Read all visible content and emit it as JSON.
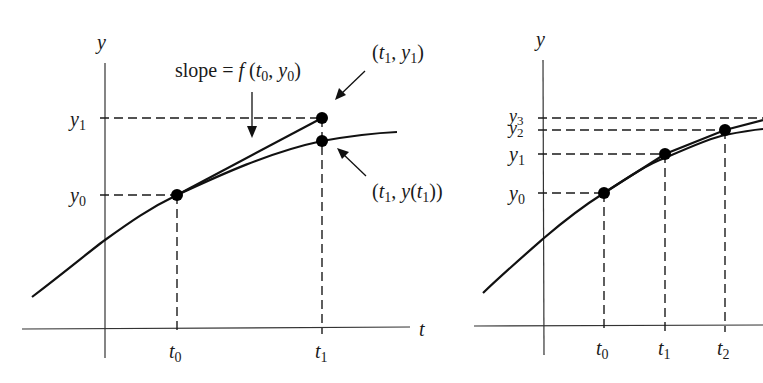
{
  "figure": {
    "left_panel": {
      "y_axis_label": "y",
      "t_axis_label": "t",
      "y_ticks": [
        {
          "base": "y",
          "sub": "1"
        },
        {
          "base": "y",
          "sub": "0"
        }
      ],
      "t_ticks": [
        {
          "base": "t",
          "sub": "0"
        },
        {
          "base": "t",
          "sub": "1"
        }
      ],
      "annotations": {
        "slope": {
          "prefix": "slope = ",
          "func": "f",
          "open": " (",
          "t": "t",
          "t_sub": "0",
          "comma": ", ",
          "y": "y",
          "y_sub": "0",
          "close": ")"
        },
        "euler_point": {
          "open": "(",
          "t": "t",
          "t_sub": "1",
          "comma": ", ",
          "y": "y",
          "y_sub": "1",
          "close": ")"
        },
        "exact_point": {
          "open": "(",
          "t": "t",
          "t_sub": "1",
          "comma": ", ",
          "y": "y",
          "mid": "(",
          "t2": "t",
          "t2_sub": "1",
          "close": "))"
        }
      }
    },
    "right_panel": {
      "y_axis_label": "y",
      "y_ticks": [
        {
          "base": "y",
          "sub": "3"
        },
        {
          "base": "y",
          "sub": "2"
        },
        {
          "base": "y",
          "sub": "1"
        },
        {
          "base": "y",
          "sub": "0"
        }
      ],
      "t_ticks": [
        {
          "base": "t",
          "sub": "0"
        },
        {
          "base": "t",
          "sub": "1"
        },
        {
          "base": "t",
          "sub": "2"
        }
      ]
    },
    "colors": {
      "ink": "#111111",
      "axis": "#333333",
      "background": "#ffffff"
    }
  }
}
